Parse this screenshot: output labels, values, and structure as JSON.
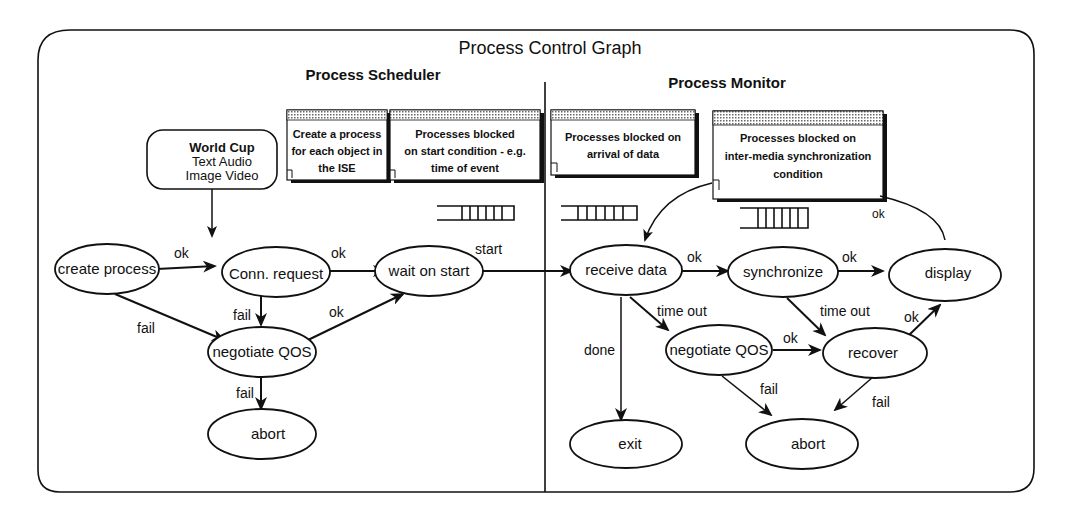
{
  "diagram": {
    "title": "Process Control Graph",
    "sections": {
      "left": "Process Scheduler",
      "right": "Process Monitor"
    },
    "source_box": {
      "lines": [
        "World Cup",
        "Text   Audio",
        "Image  Video"
      ]
    },
    "notes": [
      {
        "id": "create-process-note",
        "lines": [
          "Create a process",
          "for each object in",
          "the ISE"
        ]
      },
      {
        "id": "blocked-start-note",
        "lines": [
          "Processes blocked",
          "on start condition - e.g.",
          "time of event"
        ]
      },
      {
        "id": "blocked-data-note",
        "lines": [
          "Processes blocked on",
          "arrival of data"
        ]
      },
      {
        "id": "blocked-sync-note",
        "lines": [
          "Processes blocked on",
          "inter-media synchronization",
          "condition"
        ]
      }
    ],
    "nodes": {
      "create_process": "create process",
      "conn_request": "Conn. request",
      "wait_on_start": "wait on start",
      "negotiate_qos_left": "negotiate QOS",
      "abort_left": "abort",
      "receive_data": "receive data",
      "synchronize": "synchronize",
      "display": "display",
      "negotiate_qos_right": "negotiate QOS",
      "recover": "recover",
      "exit": "exit",
      "abort_right": "abort"
    },
    "edges": {
      "create_to_conn": "ok",
      "create_to_negotiate": "fail",
      "conn_to_wait": "ok",
      "conn_to_negotiate": "fail",
      "negotiate_to_wait": "ok",
      "negotiate_to_abort": "fail",
      "wait_to_receive": "start",
      "receive_to_sync": "ok",
      "receive_to_negotiate": "time out",
      "receive_to_exit": "done",
      "sync_to_display": "ok",
      "sync_to_recover": "time out",
      "negotiate_to_recover": "ok",
      "recover_to_display": "ok",
      "negotiate_r_to_abort": "fail",
      "recover_to_abort": "fail",
      "display_loop": "ok"
    }
  }
}
